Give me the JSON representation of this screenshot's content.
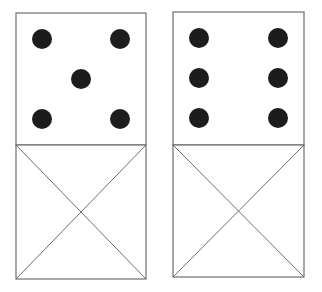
{
  "colors": {
    "line": "#6e6e6e",
    "pip": "#1c1c1c",
    "background": "#ffffff"
  },
  "dominoes": [
    {
      "name": "domino-five",
      "top_half": {
        "pips": 5
      },
      "bottom_half": {
        "type": "crossed-blank"
      }
    },
    {
      "name": "domino-six",
      "top_half": {
        "pips": 6
      },
      "bottom_half": {
        "type": "crossed-blank"
      }
    }
  ]
}
